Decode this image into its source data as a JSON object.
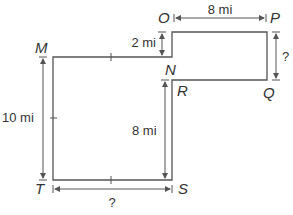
{
  "diagram": {
    "vertices": {
      "M": "M",
      "N": "N",
      "O": "O",
      "P": "P",
      "Q": "Q",
      "R": "R",
      "S": "S",
      "T": "T"
    },
    "measurements": {
      "OP": "8 mi",
      "ON": "2 mi",
      "PQ": "?",
      "MT": "10 mi",
      "RS": "8 mi",
      "TS": "?"
    },
    "colors": {
      "stroke": "#555555",
      "text": "#333333",
      "background": "#ffffff"
    }
  }
}
